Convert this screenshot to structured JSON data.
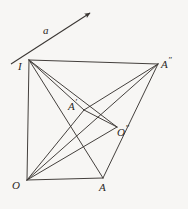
{
  "figure": {
    "background_color": "#f7f6f4",
    "stroke_color": "#3a3633",
    "label_color": "#2a2724",
    "width": 188,
    "height": 209
  },
  "vector": {
    "name": "a",
    "label": "a",
    "label_x": 43,
    "label_y": 25,
    "tail": {
      "x": 11,
      "y": 64
    },
    "tip": {
      "x": 90,
      "y": 13
    },
    "arrowhead": "filled-triangle"
  },
  "points": [
    {
      "id": "I",
      "label": "I",
      "prime": "",
      "x": 29,
      "y": 60,
      "label_x": 18,
      "label_y": 61
    },
    {
      "id": "A2",
      "label": "A",
      "prime": "″",
      "x": 158,
      "y": 64,
      "label_x": 161,
      "label_y": 56
    },
    {
      "id": "A1",
      "label": "A",
      "prime": "′",
      "x": 84,
      "y": 110,
      "label_x": 68,
      "label_y": 98
    },
    {
      "id": "O2",
      "label": "O",
      "prime": "″",
      "x": 117,
      "y": 127,
      "label_x": 117,
      "label_y": 124
    },
    {
      "id": "O",
      "label": "O",
      "prime": "",
      "x": 27,
      "y": 180,
      "label_x": 12,
      "label_y": 180
    },
    {
      "id": "A",
      "label": "A",
      "prime": "",
      "x": 103,
      "y": 178,
      "label_x": 99,
      "label_y": 182
    }
  ],
  "segments": [
    {
      "name": "I-A2",
      "from": "I",
      "to": "A2"
    },
    {
      "name": "I-O",
      "from": "I",
      "to": "O"
    },
    {
      "name": "I-A1",
      "from": "I",
      "to": "A1"
    },
    {
      "name": "I-O2",
      "from": "I",
      "to": "O2"
    },
    {
      "name": "I-A",
      "from": "I",
      "to": "A"
    },
    {
      "name": "O-A",
      "from": "O",
      "to": "A"
    },
    {
      "name": "O-A1",
      "from": "O",
      "to": "A1"
    },
    {
      "name": "O-A2",
      "from": "O",
      "to": "A2"
    },
    {
      "name": "O-O2",
      "from": "O",
      "to": "O2"
    },
    {
      "name": "A-A2",
      "from": "A",
      "to": "A2"
    },
    {
      "name": "A1-O2",
      "from": "A1",
      "to": "O2"
    },
    {
      "name": "A1-A2",
      "from": "A1",
      "to": "A2"
    }
  ]
}
